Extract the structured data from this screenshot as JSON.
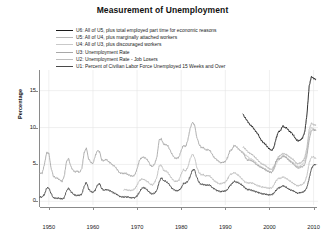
{
  "chart_data": {
    "type": "line",
    "title": "Measurement of Unemployment",
    "xlabel": "",
    "ylabel": "Percentage",
    "xlim": [
      1948,
      2011
    ],
    "ylim": [
      -0.5,
      17.8
    ],
    "xticks": [
      1950,
      1960,
      1970,
      1980,
      1990,
      2000,
      2010
    ],
    "yticks": [
      0,
      5,
      10,
      15
    ],
    "grid": true,
    "legend_position": "upper-left-inside",
    "series": [
      {
        "name": "U6: All of U5, plus total employed part time for economic reasons",
        "short": "U6",
        "color": "#1a1a1a",
        "width": 0.9,
        "x": [
          1994.0,
          1994.5,
          1995.0,
          1995.5,
          1996.0,
          1996.5,
          1997.0,
          1997.5,
          1998.0,
          1998.5,
          1999.0,
          1999.5,
          2000.0,
          2000.5,
          2001.0,
          2001.5,
          2002.0,
          2002.5,
          2003.0,
          2003.5,
          2004.0,
          2004.5,
          2005.0,
          2005.5,
          2006.0,
          2006.5,
          2007.0,
          2007.5,
          2008.0,
          2008.5,
          2009.0,
          2009.5,
          2010.0,
          2010.5
        ],
        "y": [
          11.8,
          11.3,
          10.9,
          10.4,
          10.2,
          9.8,
          9.4,
          9.0,
          8.4,
          8.0,
          7.8,
          7.4,
          7.1,
          6.9,
          7.3,
          8.5,
          9.4,
          9.6,
          10.2,
          10.0,
          9.9,
          9.5,
          9.3,
          8.9,
          8.4,
          8.2,
          8.3,
          8.6,
          9.4,
          11.8,
          15.6,
          16.9,
          16.7,
          16.5
        ]
      },
      {
        "name": "U5: All of U4, plus marginally attached workers",
        "short": "U5",
        "color": "#b8b8b8",
        "width": 0.9,
        "x": [
          1994.0,
          1994.5,
          1995.0,
          1995.5,
          1996.0,
          1996.5,
          1997.0,
          1997.5,
          1998.0,
          1998.5,
          1999.0,
          1999.5,
          2000.0,
          2000.5,
          2001.0,
          2001.5,
          2002.0,
          2002.5,
          2003.0,
          2003.5,
          2004.0,
          2004.5,
          2005.0,
          2005.5,
          2006.0,
          2006.5,
          2007.0,
          2007.5,
          2008.0,
          2008.5,
          2009.0,
          2009.5,
          2010.0,
          2010.5
        ],
        "y": [
          7.4,
          7.1,
          6.8,
          6.5,
          6.4,
          6.1,
          5.8,
          5.5,
          5.2,
          5.0,
          4.9,
          4.6,
          4.4,
          4.3,
          4.7,
          5.4,
          6.0,
          6.2,
          6.5,
          6.4,
          6.3,
          6.0,
          5.8,
          5.6,
          5.2,
          5.1,
          5.2,
          5.4,
          5.9,
          7.3,
          9.7,
          10.6,
          10.4,
          10.3
        ]
      },
      {
        "name": "U4: All of U3, plus discouraged workers",
        "short": "U4",
        "color": "#c9c9c9",
        "width": 0.9,
        "x": [
          1994.0,
          1994.5,
          1995.0,
          1995.5,
          1996.0,
          1996.5,
          1997.0,
          1997.5,
          1998.0,
          1998.5,
          1999.0,
          1999.5,
          2000.0,
          2000.5,
          2001.0,
          2001.5,
          2002.0,
          2002.5,
          2003.0,
          2003.5,
          2004.0,
          2004.5,
          2005.0,
          2005.5,
          2006.0,
          2006.5,
          2007.0,
          2007.5,
          2008.0,
          2008.5,
          2009.0,
          2009.5,
          2010.0,
          2010.5
        ],
        "y": [
          6.6,
          6.3,
          6.1,
          5.8,
          5.7,
          5.5,
          5.2,
          4.9,
          4.7,
          4.5,
          4.4,
          4.2,
          4.0,
          3.9,
          4.3,
          5.0,
          5.6,
          5.8,
          6.1,
          6.0,
          5.9,
          5.6,
          5.4,
          5.2,
          4.8,
          4.7,
          4.8,
          5.0,
          5.5,
          6.8,
          9.1,
          10.0,
          9.8,
          9.7
        ]
      },
      {
        "name": "U3: Unemployment Rate",
        "short": "U3",
        "color": "#a8a8a8",
        "width": 0.9,
        "x": [
          1948.0,
          1948.5,
          1949.0,
          1949.5,
          1950.0,
          1950.5,
          1951.0,
          1951.5,
          1952.0,
          1952.5,
          1953.0,
          1953.5,
          1954.0,
          1954.5,
          1955.0,
          1955.5,
          1956.0,
          1956.5,
          1957.0,
          1957.5,
          1958.0,
          1958.5,
          1959.0,
          1959.5,
          1960.0,
          1960.5,
          1961.0,
          1961.5,
          1962.0,
          1962.5,
          1963.0,
          1963.5,
          1964.0,
          1964.5,
          1965.0,
          1965.5,
          1966.0,
          1966.5,
          1967.0,
          1967.5,
          1968.0,
          1968.5,
          1969.0,
          1969.5,
          1970.0,
          1970.5,
          1971.0,
          1971.5,
          1972.0,
          1972.5,
          1973.0,
          1973.5,
          1974.0,
          1974.5,
          1975.0,
          1975.5,
          1976.0,
          1976.5,
          1977.0,
          1977.5,
          1978.0,
          1978.5,
          1979.0,
          1979.5,
          1980.0,
          1980.5,
          1981.0,
          1981.5,
          1982.0,
          1982.5,
          1983.0,
          1983.5,
          1984.0,
          1984.5,
          1985.0,
          1985.5,
          1986.0,
          1986.5,
          1987.0,
          1987.5,
          1988.0,
          1988.5,
          1989.0,
          1989.5,
          1990.0,
          1990.5,
          1991.0,
          1991.5,
          1992.0,
          1992.5,
          1993.0,
          1993.5,
          1994.0,
          1994.5,
          1995.0,
          1995.5,
          1996.0,
          1996.5,
          1997.0,
          1997.5,
          1998.0,
          1998.5,
          1999.0,
          1999.5,
          2000.0,
          2000.5,
          2001.0,
          2001.5,
          2002.0,
          2002.5,
          2003.0,
          2003.5,
          2004.0,
          2004.5,
          2005.0,
          2005.5,
          2006.0,
          2006.5,
          2007.0,
          2007.5,
          2008.0,
          2008.5,
          2009.0,
          2009.5,
          2010.0,
          2010.5
        ],
        "y": [
          3.8,
          3.8,
          5.0,
          6.6,
          6.5,
          4.6,
          3.4,
          3.2,
          3.1,
          2.9,
          2.7,
          3.4,
          5.4,
          5.8,
          4.7,
          4.2,
          4.0,
          4.1,
          3.9,
          4.5,
          6.6,
          7.2,
          5.8,
          5.3,
          5.1,
          6.1,
          6.9,
          6.7,
          5.6,
          5.5,
          5.7,
          5.4,
          5.2,
          4.9,
          4.7,
          4.3,
          3.9,
          3.8,
          3.8,
          3.8,
          3.6,
          3.5,
          3.4,
          3.6,
          4.4,
          5.5,
          5.9,
          6.0,
          5.8,
          5.5,
          4.9,
          4.7,
          5.1,
          6.0,
          8.3,
          8.5,
          7.7,
          7.7,
          7.5,
          6.9,
          6.3,
          5.9,
          5.8,
          6.0,
          6.9,
          7.6,
          7.4,
          8.3,
          9.8,
          10.7,
          10.4,
          8.8,
          7.8,
          7.3,
          7.3,
          7.0,
          7.0,
          6.9,
          6.4,
          5.9,
          5.7,
          5.4,
          5.2,
          5.3,
          5.4,
          5.9,
          6.8,
          7.0,
          7.6,
          7.4,
          7.1,
          6.8,
          6.6,
          6.0,
          5.6,
          5.6,
          5.5,
          5.3,
          5.0,
          4.8,
          4.6,
          4.5,
          4.3,
          4.1,
          4.0,
          3.9,
          4.5,
          5.4,
          5.8,
          5.8,
          6.1,
          6.1,
          5.8,
          5.5,
          5.3,
          5.0,
          4.7,
          4.5,
          4.6,
          4.7,
          5.0,
          6.2,
          8.3,
          9.6,
          9.7,
          9.6
        ]
      },
      {
        "name": "U2: Unemployment Rate -  Job Losers",
        "short": "U2",
        "color": "#bdbdbd",
        "width": 0.9,
        "x": [
          1967.0,
          1967.5,
          1968.0,
          1968.5,
          1969.0,
          1969.5,
          1970.0,
          1970.5,
          1971.0,
          1971.5,
          1972.0,
          1972.5,
          1973.0,
          1973.5,
          1974.0,
          1974.5,
          1975.0,
          1975.5,
          1976.0,
          1976.5,
          1977.0,
          1977.5,
          1978.0,
          1978.5,
          1979.0,
          1979.5,
          1980.0,
          1980.5,
          1981.0,
          1981.5,
          1982.0,
          1982.5,
          1983.0,
          1983.5,
          1984.0,
          1984.5,
          1985.0,
          1985.5,
          1986.0,
          1986.5,
          1987.0,
          1987.5,
          1988.0,
          1988.5,
          1989.0,
          1989.5,
          1990.0,
          1990.5,
          1991.0,
          1991.5,
          1992.0,
          1992.5,
          1993.0,
          1993.5,
          1994.0,
          1994.5,
          1995.0,
          1995.5,
          1996.0,
          1996.5,
          1997.0,
          1997.5,
          1998.0,
          1998.5,
          1999.0,
          1999.5,
          2000.0,
          2000.5,
          2001.0,
          2001.5,
          2002.0,
          2002.5,
          2003.0,
          2003.5,
          2004.0,
          2004.5,
          2005.0,
          2005.5,
          2006.0,
          2006.5,
          2007.0,
          2007.5,
          2008.0,
          2008.5,
          2009.0,
          2009.5,
          2010.0,
          2010.5
        ],
        "y": [
          1.6,
          1.6,
          1.5,
          1.5,
          1.5,
          1.7,
          2.2,
          2.8,
          3.0,
          3.0,
          2.8,
          2.6,
          2.3,
          2.2,
          2.6,
          3.3,
          4.8,
          4.9,
          4.2,
          4.1,
          3.9,
          3.4,
          3.0,
          2.7,
          2.7,
          2.9,
          3.7,
          4.3,
          4.1,
          4.6,
          5.7,
          6.4,
          6.0,
          4.7,
          3.9,
          3.6,
          3.6,
          3.4,
          3.5,
          3.4,
          3.1,
          2.8,
          2.6,
          2.4,
          2.4,
          2.5,
          2.6,
          3.0,
          3.6,
          3.7,
          3.9,
          3.7,
          3.5,
          3.2,
          2.9,
          2.6,
          2.5,
          2.5,
          2.5,
          2.4,
          2.2,
          2.1,
          2.0,
          1.9,
          1.9,
          1.8,
          1.8,
          1.8,
          2.2,
          2.8,
          3.1,
          3.1,
          3.3,
          3.2,
          3.0,
          2.8,
          2.6,
          2.4,
          2.2,
          2.1,
          2.2,
          2.3,
          2.6,
          3.5,
          5.2,
          6.0,
          6.0,
          5.8
        ]
      },
      {
        "name": "U1: Percent of Civilian Labor Force Unemployed 15 Weeks and Over",
        "short": "U1",
        "color": "#4a4a4a",
        "width": 0.9,
        "x": [
          1948.0,
          1948.5,
          1949.0,
          1949.5,
          1950.0,
          1950.5,
          1951.0,
          1951.5,
          1952.0,
          1952.5,
          1953.0,
          1953.5,
          1954.0,
          1954.5,
          1955.0,
          1955.5,
          1956.0,
          1956.5,
          1957.0,
          1957.5,
          1958.0,
          1958.5,
          1959.0,
          1959.5,
          1960.0,
          1960.5,
          1961.0,
          1961.5,
          1962.0,
          1962.5,
          1963.0,
          1963.5,
          1964.0,
          1964.5,
          1965.0,
          1965.5,
          1966.0,
          1966.5,
          1967.0,
          1967.5,
          1968.0,
          1968.5,
          1969.0,
          1969.5,
          1970.0,
          1970.5,
          1971.0,
          1971.5,
          1972.0,
          1972.5,
          1973.0,
          1973.5,
          1974.0,
          1974.5,
          1975.0,
          1975.5,
          1976.0,
          1976.5,
          1977.0,
          1977.5,
          1978.0,
          1978.5,
          1979.0,
          1979.5,
          1980.0,
          1980.5,
          1981.0,
          1981.5,
          1982.0,
          1982.5,
          1983.0,
          1983.5,
          1984.0,
          1984.5,
          1985.0,
          1985.5,
          1986.0,
          1986.5,
          1987.0,
          1987.5,
          1988.0,
          1988.5,
          1989.0,
          1989.5,
          1990.0,
          1990.5,
          1991.0,
          1991.5,
          1992.0,
          1992.5,
          1993.0,
          1993.5,
          1994.0,
          1994.5,
          1995.0,
          1995.5,
          1996.0,
          1996.5,
          1997.0,
          1997.5,
          1998.0,
          1998.5,
          1999.0,
          1999.5,
          2000.0,
          2000.5,
          2001.0,
          2001.5,
          2002.0,
          2002.5,
          2003.0,
          2003.5,
          2004.0,
          2004.5,
          2005.0,
          2005.5,
          2006.0,
          2006.5,
          2007.0,
          2007.5,
          2008.0,
          2008.5,
          2009.0,
          2009.5,
          2010.0,
          2010.5
        ],
        "y": [
          0.6,
          0.6,
          0.9,
          1.8,
          1.8,
          1.1,
          0.5,
          0.4,
          0.4,
          0.4,
          0.3,
          0.5,
          1.4,
          1.8,
          1.3,
          1.0,
          0.8,
          0.8,
          0.8,
          1.0,
          2.0,
          2.6,
          1.7,
          1.3,
          1.2,
          1.5,
          2.2,
          2.4,
          1.7,
          1.5,
          1.6,
          1.5,
          1.4,
          1.2,
          1.1,
          0.9,
          0.7,
          0.6,
          0.6,
          0.6,
          0.6,
          0.5,
          0.5,
          0.5,
          0.7,
          1.2,
          1.7,
          1.9,
          1.7,
          1.4,
          1.1,
          1.0,
          1.1,
          1.5,
          2.6,
          3.2,
          2.8,
          2.7,
          2.5,
          2.1,
          1.7,
          1.5,
          1.4,
          1.5,
          1.8,
          2.4,
          2.5,
          2.7,
          3.3,
          4.2,
          4.3,
          3.3,
          2.6,
          2.3,
          2.3,
          2.2,
          2.2,
          2.2,
          1.9,
          1.7,
          1.5,
          1.4,
          1.3,
          1.4,
          1.4,
          1.6,
          2.1,
          2.4,
          2.7,
          2.6,
          2.5,
          2.3,
          2.1,
          1.8,
          1.6,
          1.6,
          1.5,
          1.4,
          1.3,
          1.2,
          1.1,
          1.0,
          1.0,
          0.9,
          0.9,
          0.9,
          1.1,
          1.5,
          1.8,
          1.9,
          2.1,
          2.0,
          1.8,
          1.6,
          1.5,
          1.4,
          1.2,
          1.1,
          1.2,
          1.2,
          1.4,
          1.9,
          3.1,
          4.4,
          4.9,
          5.0
        ]
      }
    ]
  },
  "axis": {
    "y_title": "Percentage",
    "y_tick_labels": [
      "15",
      "10",
      "5",
      "0"
    ],
    "x_tick_labels": [
      "1950",
      "1960",
      "1970",
      "1980",
      "1990",
      "2000",
      "2010"
    ]
  },
  "colors": {
    "background": "#ffffff",
    "axis": "#8a8a8a",
    "grid": "#e6e6e6",
    "text": "#1a1a1a"
  }
}
